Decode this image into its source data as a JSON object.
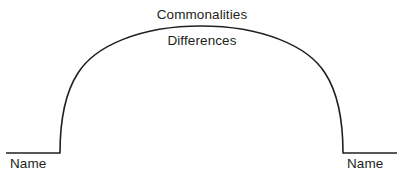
{
  "diagram": {
    "type": "comparison-arch",
    "title_above_arch": "Commonalities",
    "title_inside_arch": "Differences",
    "left_entity_label": "Name",
    "right_entity_label": "Name",
    "colors": {
      "background": "#ffffff",
      "stroke": "#231f20",
      "text": "#231f20"
    },
    "geometry": {
      "canvas_width": 404,
      "canvas_height": 185,
      "baseline_y": 153,
      "apex_y": 26,
      "apex_x": 201,
      "left_baseline_start_x": 6,
      "left_foot_x": 60,
      "right_foot_x": 343,
      "right_baseline_end_x": 397,
      "stroke_width": 1.6
    }
  }
}
